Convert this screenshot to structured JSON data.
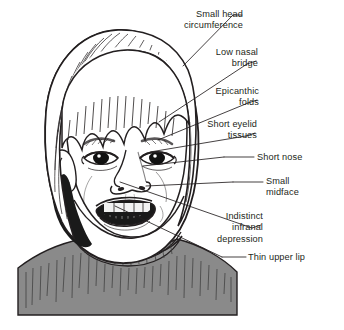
{
  "figure": {
    "background_color": "#ffffff",
    "ink_color": "#231f20",
    "sweater_color": "#8a8a8a",
    "skin_color": "#ffffff",
    "hair_color": "#ffffff"
  },
  "annotations": [
    {
      "id": "small-head-circumference",
      "lines": [
        "Small head",
        "circumference"
      ],
      "text": "Small head circumference",
      "align": "right",
      "text_x": 243,
      "text_y": 9,
      "dash_x1": 233,
      "dash_y1": 15,
      "dash_x2": 242,
      "dash_y2": 15,
      "leader_x1": 233,
      "leader_y1": 15,
      "leader_x2": 183,
      "leader_y2": 66
    },
    {
      "id": "low-nasal-bridge",
      "lines": [
        "Low nasal",
        "bridge"
      ],
      "text": "Low nasal bridge",
      "align": "right",
      "text_x": 258,
      "text_y": 47,
      "dash_x1": 247,
      "dash_y1": 64,
      "dash_x2": 256,
      "dash_y2": 61,
      "leader_x1": 247,
      "leader_y1": 64,
      "leader_x2": 159,
      "leader_y2": 122
    },
    {
      "id": "epicanthic-folds",
      "lines": [
        "Epicanthic",
        "folds"
      ],
      "text": "Epicanthic folds",
      "align": "right",
      "text_x": 259,
      "text_y": 86,
      "dash_x1": 248,
      "dash_y1": 103,
      "dash_x2": 257,
      "dash_y2": 100,
      "leader_x1": 248,
      "leader_y1": 103,
      "leader_x2": 158,
      "leader_y2": 140
    },
    {
      "id": "short-eyelid-tissues",
      "lines": [
        "Short eyelid",
        "tissues"
      ],
      "text": "Short eyelid tissues",
      "align": "right",
      "text_x": 257,
      "text_y": 119,
      "dash_x1": 246,
      "dash_y1": 136,
      "dash_x2": 255,
      "dash_y2": 133,
      "leader_x1": 246,
      "leader_y1": 136,
      "leader_x2": 150,
      "leader_y2": 152
    },
    {
      "id": "short-nose",
      "lines": [
        "Short nose"
      ],
      "text": "Short nose",
      "align": "left",
      "text_x": 257,
      "text_y": 152,
      "dash_x1": 224,
      "dash_y1": 157,
      "dash_x2": 254,
      "dash_y2": 157,
      "leader_x1": 224,
      "leader_y1": 157,
      "leader_x2": 143,
      "leader_y2": 166
    },
    {
      "id": "small-midface",
      "lines": [
        "Small",
        "midface"
      ],
      "text": "Small midface",
      "align": "left",
      "text_x": 266,
      "text_y": 176,
      "dash_x1": 233,
      "dash_y1": 182,
      "dash_x2": 263,
      "dash_y2": 182,
      "leader_x1": 233,
      "leader_y1": 182,
      "leader_x2": 146,
      "leader_y2": 186
    },
    {
      "id": "indistinct-infranal-depression",
      "lines": [
        "Indistinct",
        "infranal",
        "depression"
      ],
      "text": "Indistinct infranal depression",
      "align": "right",
      "text_x": 263,
      "text_y": 211,
      "dash_x1": 252,
      "dash_y1": 228,
      "dash_x2": 261,
      "dash_y2": 225,
      "leader_x1": 252,
      "leader_y1": 228,
      "leader_x2": 120,
      "leader_y2": 182
    },
    {
      "id": "thin-upper-lip",
      "lines": [
        "Thin upper lip"
      ],
      "text": "Thin upper lip",
      "align": "left",
      "text_x": 248,
      "text_y": 252,
      "dash_x1": 222,
      "dash_y1": 257,
      "dash_x2": 246,
      "dash_y2": 257,
      "leader_x1": 222,
      "leader_y1": 257,
      "leader_x2": 115,
      "leader_y2": 206
    }
  ]
}
